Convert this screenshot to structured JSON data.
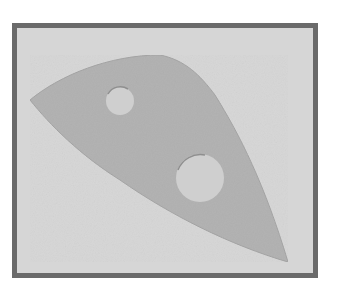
{
  "image": {
    "description": "Framed photograph of a flat gray wedge-shaped plate with two circular holes",
    "colors": {
      "frame": "#6a6a6a",
      "background": "#d6d6d6",
      "plate": "#b3b3b3",
      "hole": "#cfcfcf"
    },
    "objects": [
      {
        "name": "plate",
        "shape": "curved wedge",
        "holes": 2
      },
      {
        "name": "small-hole",
        "cx": 120,
        "cy": 101,
        "r": 14
      },
      {
        "name": "large-hole",
        "cx": 200,
        "cy": 178,
        "r": 24
      }
    ]
  }
}
